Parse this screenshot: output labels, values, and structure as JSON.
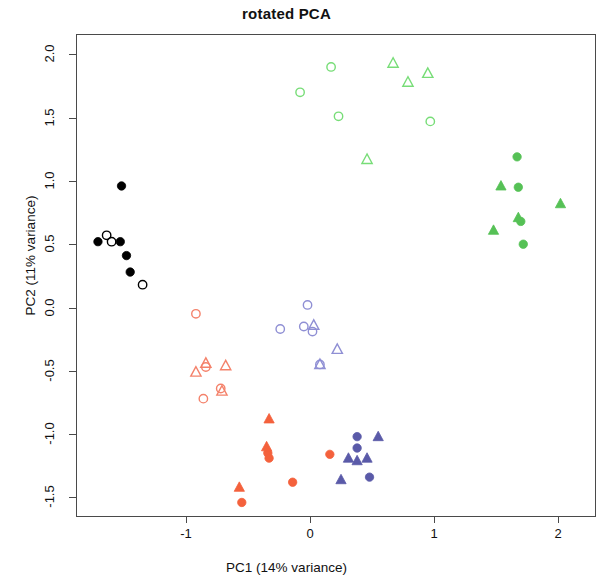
{
  "chart_data": {
    "type": "scatter",
    "title": "rotated PCA",
    "xlabel": "PC1 (14% variance)",
    "ylabel": "PC2 (11% variance)",
    "xlim": [
      -1.87,
      2.12
    ],
    "ylim": [
      -1.62,
      2.07
    ],
    "xticks": [
      -1,
      0,
      1,
      2
    ],
    "xtick_labels": [
      "-1",
      "0",
      "1",
      "2"
    ],
    "yticks": [
      -1.5,
      -1.0,
      -0.5,
      0.0,
      0.5,
      1.0,
      1.5,
      2.0
    ],
    "ytick_labels": [
      "-1.5",
      "-1.0",
      "-0.5",
      "0.0",
      "0.5",
      "1.0",
      "1.5",
      "2.0"
    ],
    "grid": false,
    "legend": "none",
    "box": true,
    "series": [
      {
        "name": "black-group",
        "color": "#000000",
        "marker": "mixed",
        "points": [
          {
            "x": -1.52,
            "y": 0.96,
            "marker": "filled-circle"
          },
          {
            "x": -1.71,
            "y": 0.52,
            "marker": "filled-circle"
          },
          {
            "x": -1.53,
            "y": 0.52,
            "marker": "filled-circle"
          },
          {
            "x": -1.48,
            "y": 0.41,
            "marker": "filled-circle"
          },
          {
            "x": -1.45,
            "y": 0.28,
            "marker": "filled-circle"
          },
          {
            "x": -1.64,
            "y": 0.57,
            "marker": "open-circle"
          },
          {
            "x": -1.6,
            "y": 0.52,
            "marker": "open-circle"
          },
          {
            "x": -1.35,
            "y": 0.18,
            "marker": "open-circle"
          }
        ]
      },
      {
        "name": "light-green-group",
        "color": "#77dd77",
        "marker": "mixed",
        "points": [
          {
            "x": 0.17,
            "y": 1.9,
            "marker": "open-circle"
          },
          {
            "x": -0.08,
            "y": 1.7,
            "marker": "open-circle"
          },
          {
            "x": 0.23,
            "y": 1.51,
            "marker": "open-circle"
          },
          {
            "x": 0.97,
            "y": 1.47,
            "marker": "open-circle"
          },
          {
            "x": 0.67,
            "y": 1.93,
            "marker": "open-triangle"
          },
          {
            "x": 0.79,
            "y": 1.78,
            "marker": "open-triangle"
          },
          {
            "x": 0.95,
            "y": 1.85,
            "marker": "open-triangle"
          },
          {
            "x": 0.46,
            "y": 1.17,
            "marker": "open-triangle"
          }
        ]
      },
      {
        "name": "dark-green-group",
        "color": "#56c156",
        "marker": "mixed",
        "points": [
          {
            "x": 1.67,
            "y": 1.19,
            "marker": "filled-circle"
          },
          {
            "x": 1.68,
            "y": 0.95,
            "marker": "filled-circle"
          },
          {
            "x": 1.7,
            "y": 0.68,
            "marker": "filled-circle"
          },
          {
            "x": 1.72,
            "y": 0.5,
            "marker": "filled-circle"
          },
          {
            "x": 1.54,
            "y": 0.96,
            "marker": "filled-triangle"
          },
          {
            "x": 1.48,
            "y": 0.61,
            "marker": "filled-triangle"
          },
          {
            "x": 1.68,
            "y": 0.71,
            "marker": "filled-triangle"
          },
          {
            "x": 2.02,
            "y": 0.82,
            "marker": "filled-triangle"
          }
        ]
      },
      {
        "name": "salmon-group",
        "color": "#f4826b",
        "marker": "mixed",
        "points": [
          {
            "x": -0.92,
            "y": -0.05,
            "marker": "open-circle"
          },
          {
            "x": -0.84,
            "y": -0.47,
            "marker": "open-circle"
          },
          {
            "x": -0.86,
            "y": -0.72,
            "marker": "open-circle"
          },
          {
            "x": -0.72,
            "y": -0.64,
            "marker": "open-circle"
          },
          {
            "x": -0.92,
            "y": -0.51,
            "marker": "open-triangle"
          },
          {
            "x": -0.84,
            "y": -0.44,
            "marker": "open-triangle"
          },
          {
            "x": -0.68,
            "y": -0.46,
            "marker": "open-triangle"
          },
          {
            "x": -0.71,
            "y": -0.66,
            "marker": "open-triangle"
          }
        ]
      },
      {
        "name": "orange-red-group",
        "color": "#f4613c",
        "marker": "mixed",
        "points": [
          {
            "x": -0.34,
            "y": -1.15,
            "marker": "filled-circle"
          },
          {
            "x": -0.33,
            "y": -1.19,
            "marker": "filled-circle"
          },
          {
            "x": -0.14,
            "y": -1.38,
            "marker": "filled-circle"
          },
          {
            "x": -0.55,
            "y": -1.54,
            "marker": "filled-circle"
          },
          {
            "x": 0.16,
            "y": -1.16,
            "marker": "filled-circle"
          },
          {
            "x": -0.33,
            "y": -0.88,
            "marker": "filled-triangle"
          },
          {
            "x": -0.35,
            "y": -1.1,
            "marker": "filled-triangle"
          },
          {
            "x": -0.57,
            "y": -1.42,
            "marker": "filled-triangle"
          }
        ]
      },
      {
        "name": "periwinkle-group",
        "color": "#8f8fd4",
        "marker": "mixed",
        "points": [
          {
            "x": -0.02,
            "y": 0.02,
            "marker": "open-circle"
          },
          {
            "x": -0.24,
            "y": -0.17,
            "marker": "open-circle"
          },
          {
            "x": -0.05,
            "y": -0.15,
            "marker": "open-circle"
          },
          {
            "x": 0.02,
            "y": -0.19,
            "marker": "open-circle"
          },
          {
            "x": 0.08,
            "y": -0.45,
            "marker": "open-circle"
          },
          {
            "x": 0.03,
            "y": -0.14,
            "marker": "open-triangle"
          },
          {
            "x": 0.22,
            "y": -0.33,
            "marker": "open-triangle"
          },
          {
            "x": 0.08,
            "y": -0.45,
            "marker": "open-triangle"
          }
        ]
      },
      {
        "name": "dark-blue-group",
        "color": "#5a5aa8",
        "marker": "mixed",
        "points": [
          {
            "x": 0.38,
            "y": -1.02,
            "marker": "filled-circle"
          },
          {
            "x": 0.38,
            "y": -1.11,
            "marker": "filled-circle"
          },
          {
            "x": 0.48,
            "y": -1.34,
            "marker": "filled-circle"
          },
          {
            "x": 0.55,
            "y": -1.02,
            "marker": "filled-triangle"
          },
          {
            "x": 0.31,
            "y": -1.19,
            "marker": "filled-triangle"
          },
          {
            "x": 0.38,
            "y": -1.21,
            "marker": "filled-triangle"
          },
          {
            "x": 0.46,
            "y": -1.19,
            "marker": "filled-triangle"
          },
          {
            "x": 0.25,
            "y": -1.36,
            "marker": "filled-triangle"
          }
        ]
      }
    ]
  }
}
